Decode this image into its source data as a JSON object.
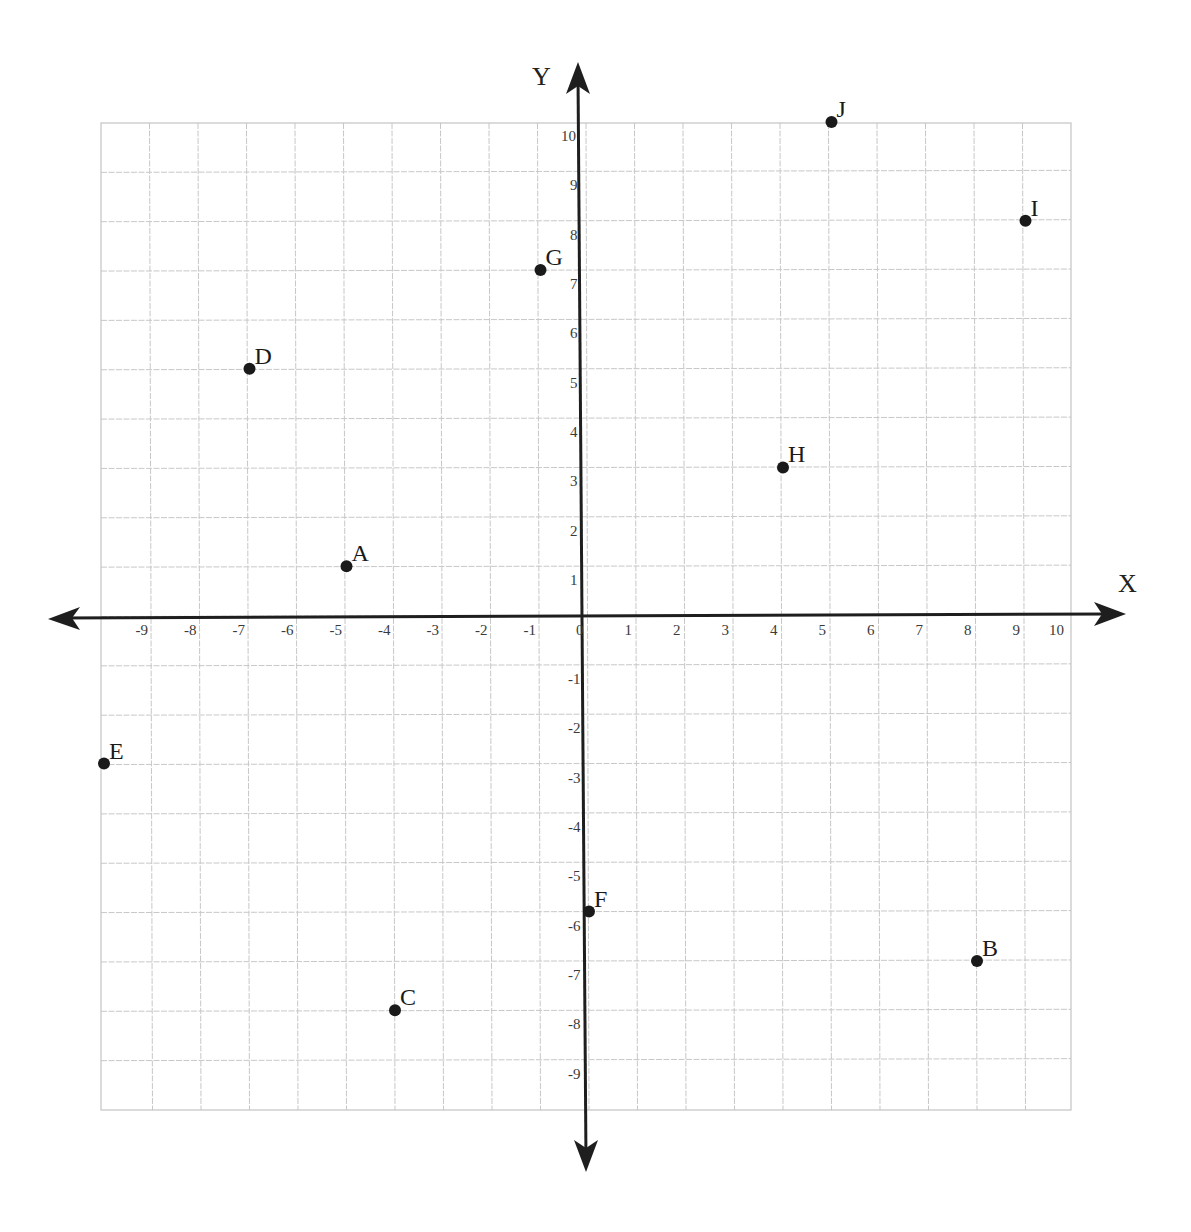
{
  "chart_data": {
    "type": "scatter",
    "title": "",
    "xlabel": "X",
    "ylabel": "Y",
    "xlim": [
      -10,
      10
    ],
    "ylim": [
      -10,
      10
    ],
    "grid": true,
    "legend": null,
    "x_ticks": [
      -9,
      -8,
      -7,
      -6,
      -5,
      -4,
      -3,
      -2,
      -1,
      0,
      1,
      2,
      3,
      4,
      5,
      6,
      7,
      8,
      9,
      10
    ],
    "y_ticks": [
      10,
      9,
      8,
      7,
      6,
      5,
      4,
      3,
      2,
      1,
      -1,
      -2,
      -3,
      -4,
      -5,
      -6,
      -7,
      -8,
      -9
    ],
    "points": [
      {
        "label": "A",
        "x": -5,
        "y": 1
      },
      {
        "label": "B",
        "x": 8,
        "y": -7
      },
      {
        "label": "C",
        "x": -4,
        "y": -8
      },
      {
        "label": "D",
        "x": -7,
        "y": 5
      },
      {
        "label": "E",
        "x": -10,
        "y": -3
      },
      {
        "label": "F",
        "x": 0,
        "y": -6
      },
      {
        "label": "G",
        "x": -1,
        "y": 7
      },
      {
        "label": "H",
        "x": 4,
        "y": 3
      },
      {
        "label": "I",
        "x": 9,
        "y": 8
      },
      {
        "label": "J",
        "x": 5,
        "y": 10
      }
    ],
    "colors": {
      "point": "#1a1a1a",
      "axis": "#1e1e1e",
      "grid": "#c8c8c8"
    }
  }
}
